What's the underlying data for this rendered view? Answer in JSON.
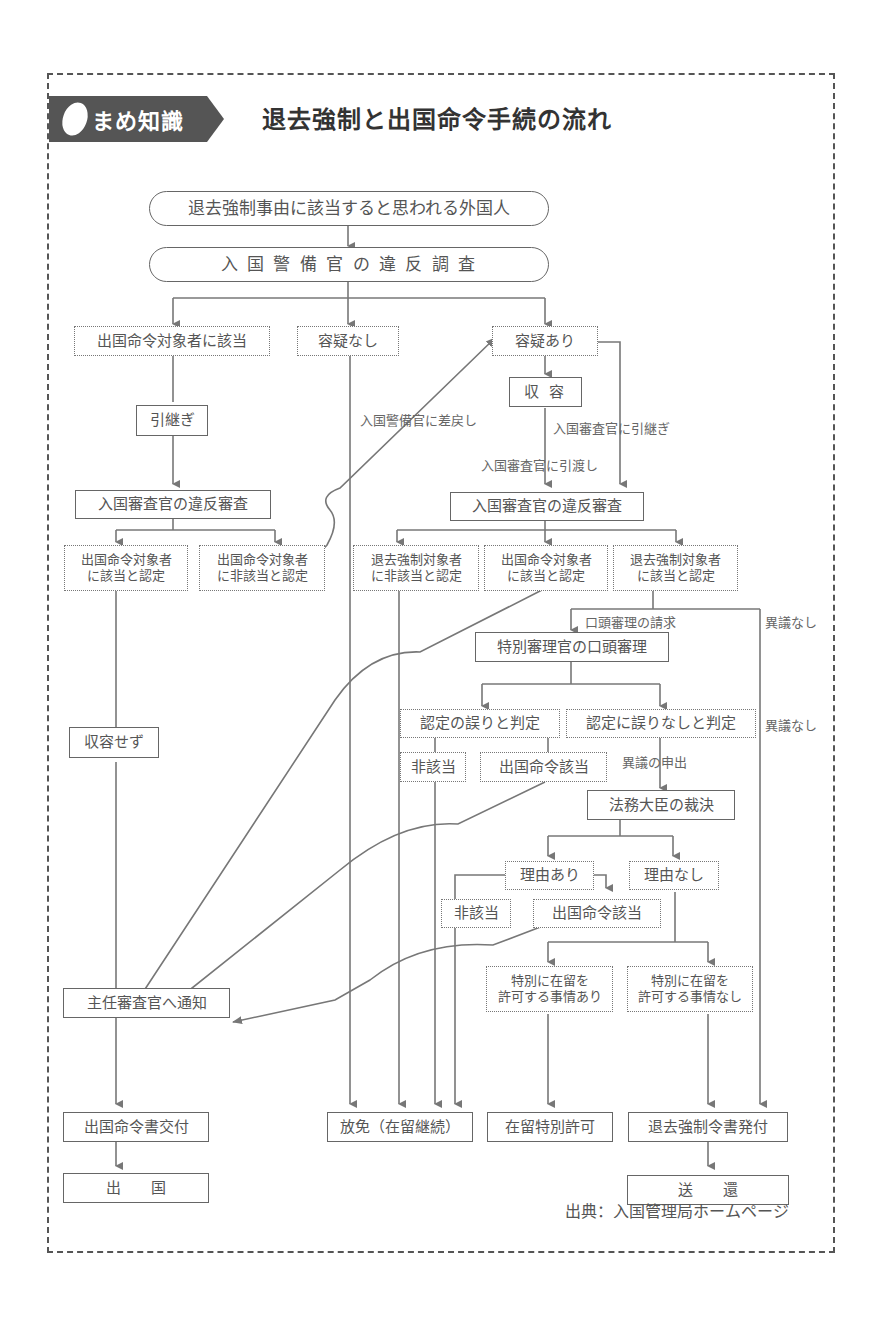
{
  "header": {
    "badge_label": "まめ知識",
    "title": "退去強制と出国命令手続の流れ"
  },
  "nodes": {
    "start": "退去強制事由に該当すると思われる外国人",
    "investigation": "入 国 警 備 官 の 違 反 調 査",
    "departure_order_applicable": "出国命令対象者に該当",
    "no_suspicion": "容疑なし",
    "suspicion": "容疑あり",
    "detention": "収 容",
    "handover": "引継ぎ",
    "left_examination": "入国審査官の違反審査",
    "right_examination": "入国審査官の違反審査",
    "left_do_applicable": [
      "出国命令対象者",
      "に該当と認定"
    ],
    "left_do_not_applicable": [
      "出国命令対象者",
      "に非該当と認定"
    ],
    "dep_not_applicable": [
      "退去強制対象者",
      "に非該当と認定"
    ],
    "do_applicable": [
      "出国命令対象者",
      "に該当と認定"
    ],
    "dep_applicable": [
      "退去強制対象者",
      "に該当と認定"
    ],
    "oral_hearing": "特別審理官の口頭審理",
    "not_detained": "収容せず",
    "judged_error": "認定の誤りと判定",
    "judged_no_error": "認定に誤りなしと判定",
    "hearing_not_applicable": "非該当",
    "hearing_do_applicable": "出国命令該当",
    "minister_decision": "法務大臣の裁決",
    "reason_exists": "理由あり",
    "no_reason": "理由なし",
    "decision_not_applicable": "非該当",
    "decision_do_applicable": "出国命令該当",
    "special_permission_yes": [
      "特別に在留を",
      "許可する事情あり"
    ],
    "special_permission_no": [
      "特別に在留を",
      "許可する事情なし"
    ],
    "notify_chief": "主任審査官へ通知",
    "issue_departure_order": "出国命令書交付",
    "release": "放免（在留継続）",
    "special_permission": "在留特別許可",
    "issue_deportation_order": "退去強制令書発付",
    "departure": "出　　国",
    "repatriation": "送　　還"
  },
  "edge_labels": {
    "return_to_guard": "入国警備官に差戻し",
    "transfer_to_examiner": "入国審査官に引継ぎ",
    "handover_to_examiner": "入国審査官に引渡し",
    "request_oral_hearing": "口頭審理の請求",
    "no_objection_1": "異議なし",
    "no_objection_2": "異議なし",
    "filing_objection": "異議の申出"
  },
  "footer": {
    "source": "出典：入国管理局ホームページ"
  },
  "colors": {
    "line": "#777777",
    "badge": "#555555",
    "text": "#555555"
  }
}
